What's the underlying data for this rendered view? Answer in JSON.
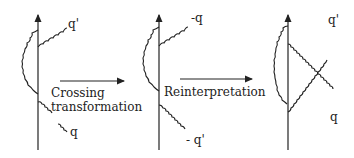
{
  "diagram": {
    "type": "crossing-transformation-feynman",
    "panels": [
      {
        "id": "initial",
        "labels": {
          "top": "q'",
          "bottom": "q"
        }
      },
      {
        "id": "crossed",
        "labels": {
          "top": "-q",
          "bottom": "- q'"
        }
      },
      {
        "id": "reinterpreted",
        "labels": {
          "top": "q'",
          "bottom": "q"
        }
      }
    ],
    "arrows": [
      {
        "label_line1": "Crossing",
        "label_line2": "transformation"
      },
      {
        "label_line1": "Reinterpretation"
      }
    ],
    "colors": {
      "ink": "#222222",
      "background": "#ffffff"
    }
  }
}
